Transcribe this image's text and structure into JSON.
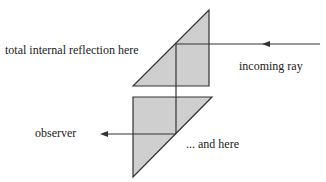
{
  "labels": {
    "tir_top": "total internal reflection here",
    "incoming": "incoming ray",
    "observer": "observer",
    "tir_bottom": "... and here"
  },
  "colors": {
    "prism_fill": "#cfcfcf",
    "stroke": "#333333",
    "background": "#ffffff"
  }
}
